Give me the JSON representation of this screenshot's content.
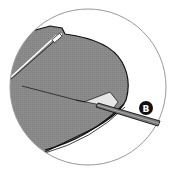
{
  "diagram": {
    "type": "instruction-detail-callout",
    "callout_label": "B",
    "colors": {
      "panel": "#8a8a8a",
      "outline": "#111111",
      "peel": "#e6e6e6",
      "tool": "#7a7a7a",
      "badge": "#111111",
      "circle_border": "#999999"
    }
  }
}
